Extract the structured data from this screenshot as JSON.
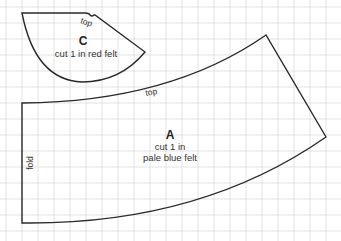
{
  "diagram": {
    "type": "sewing pattern",
    "background_color": "#ffffff",
    "grid_color": "#dcdcdc",
    "outline_color": "#2a2a2a",
    "grid": {
      "spacing_px": 16,
      "origin_x": 6,
      "origin_y": 7
    },
    "pieces": [
      {
        "id": "C",
        "letter": "C",
        "instruction": "cut 1 in red felt",
        "edge_labels": {
          "top": "top"
        }
      },
      {
        "id": "A",
        "letter": "A",
        "instruction_line1": "cut 1 in",
        "instruction_line2": "pale blue felt",
        "edge_labels": {
          "top": "top",
          "left": "fold"
        }
      }
    ]
  }
}
